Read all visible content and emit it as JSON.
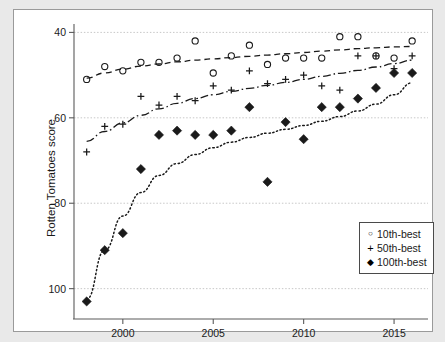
{
  "chart_data": {
    "type": "scatter",
    "title": "",
    "xlabel": "",
    "ylabel": "Rotten Tomatoes score",
    "xlim": [
      1997.3,
      2016.6
    ],
    "ylim": [
      35,
      101.5
    ],
    "xticks": [
      2000,
      2005,
      2010,
      2015
    ],
    "yticks": [
      40,
      60,
      80,
      100
    ],
    "grid": true,
    "grid_axis": "y",
    "legend_position": "lower-right",
    "x": [
      1998,
      1999,
      2000,
      2001,
      2002,
      2003,
      2004,
      2005,
      2006,
      2007,
      2008,
      2009,
      2010,
      2011,
      2012,
      2013,
      2014,
      2015,
      2016
    ],
    "series": [
      {
        "name": "10th-best",
        "marker": "open-circle",
        "trend_style": "dashed",
        "values": [
          89,
          92,
          91,
          93,
          93,
          94,
          98,
          90.5,
          94.5,
          97,
          92.5,
          94,
          94,
          94,
          99,
          99,
          94.5,
          94,
          98
        ],
        "trend": [
          89.3,
          90.5,
          91.4,
          92.1,
          92.6,
          93.1,
          93.5,
          93.8,
          94.1,
          94.4,
          94.7,
          95,
          95.3,
          95.6,
          95.9,
          96.2,
          96.4,
          96.6,
          96.7
        ]
      },
      {
        "name": "50th-best",
        "marker": "plus",
        "trend_style": "dash-dot",
        "values": [
          72,
          78,
          78.5,
          85,
          83,
          85,
          84,
          87.5,
          86.5,
          91,
          88,
          89,
          90,
          87.5,
          86.5,
          94.5,
          94.5,
          91.5,
          94.5
        ],
        "trend": [
          74.5,
          76.8,
          78.8,
          80.6,
          82.1,
          83.4,
          84.5,
          85.4,
          86.2,
          86.9,
          87.6,
          88.3,
          89,
          89.7,
          90.4,
          91.1,
          91.9,
          92.7,
          93.5
        ]
      },
      {
        "name": "100th-best",
        "marker": "filled-diamond",
        "trend_style": "dotted",
        "values": [
          37,
          49,
          53,
          68,
          76,
          77,
          76,
          76,
          77,
          82.5,
          65,
          79,
          75,
          82.5,
          82.5,
          84.5,
          87,
          90.5,
          90.5
        ],
        "trend": [
          37.5,
          49,
          57,
          62.5,
          66.5,
          69.3,
          71.4,
          73,
          74.3,
          75.4,
          76.4,
          77.3,
          78.2,
          79.2,
          80.3,
          81.6,
          83.2,
          85.4,
          88.2
        ]
      }
    ]
  },
  "axis": {
    "ylabel": "Rotten Tomatoes score",
    "ytick_labels": [
      "100",
      "80",
      "60",
      "40"
    ],
    "xtick_labels": [
      "2000",
      "2005",
      "2010",
      "2015"
    ]
  },
  "legend": {
    "items": [
      {
        "label": "10th-best",
        "marker": "open-circle-icon",
        "glyph": "○"
      },
      {
        "label": "50th-best",
        "marker": "plus-icon",
        "glyph": "+"
      },
      {
        "label": "100th-best",
        "marker": "filled-diamond-icon",
        "glyph": "◆"
      }
    ]
  },
  "colors": {
    "background": "#e9e9e9",
    "plot_background": "#ffffff",
    "frame": "#9a9a9a",
    "axis": "#5a5a5a",
    "grid": "#c8c8c8",
    "ink": "#1a1a1a"
  }
}
